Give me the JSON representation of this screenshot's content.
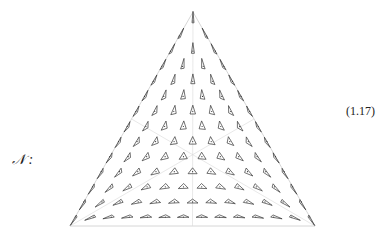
{
  "equation": {
    "symbol": "𝒩 :",
    "number": "(1.17)"
  },
  "figure": {
    "vertices": {
      "top": [
        193,
        12
      ],
      "left": [
        70,
        226
      ],
      "right": [
        315,
        226
      ]
    },
    "rows": 14,
    "outline_color": "#cccccc",
    "guide_color": "#d8d8d8",
    "glyph_color": "#333333"
  }
}
